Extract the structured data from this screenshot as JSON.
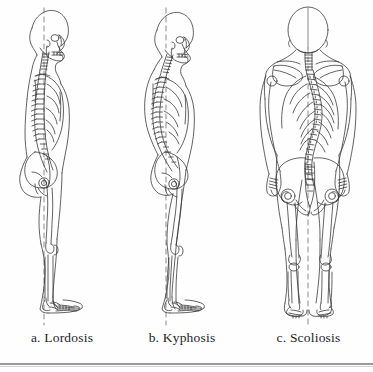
{
  "figure": {
    "type": "medical-illustration",
    "background_color": "#fefefe",
    "line_color": "#3a3a3a",
    "rule_color": "#9a9a9a"
  },
  "panels": [
    {
      "id": "a",
      "caption": "a. Lordosis",
      "view": "lateral",
      "facing": "right",
      "plumb_line": "dashed-vertical",
      "description": "Exaggerated lumbar curve (swayback), side view of skeleton within body outline"
    },
    {
      "id": "b",
      "caption": "b. Kyphosis",
      "view": "lateral",
      "facing": "right",
      "plumb_line": "dashed-vertical",
      "description": "Exaggerated thoracic curve (hunchback) with forward head, side view of skeleton within body outline"
    },
    {
      "id": "c",
      "caption": "c. Scoliosis",
      "view": "posterior",
      "facing": "back",
      "plumb_line": "dashed-vertical",
      "description": "Lateral S-shaped curvature of the spine, back view of skeleton within body outline"
    }
  ],
  "captions": {
    "a": "a. Lordosis",
    "b": "b. Kyphosis",
    "c": "c. Scoliosis"
  }
}
